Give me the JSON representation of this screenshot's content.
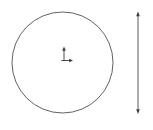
{
  "figure": {
    "title": "",
    "background_color": "#ffffff",
    "line_color": "#4f4f4f",
    "axis_color": "#3a3a3a",
    "dimension_color": "#4a4a4a",
    "width_px": 153,
    "height_px": 130
  },
  "shapes": {
    "circle": {
      "name": "circle-outline",
      "center_x": 62.5,
      "center_y": 62.5,
      "radius": 50.5,
      "stroke_width": 0.9
    },
    "origin_marker": {
      "name": "origin-axes-marker",
      "origin_x": 64,
      "origin_y": 60.5,
      "vertical_axis_length": 14,
      "horizontal_axis_length": 9,
      "vertical_label": "",
      "horizontal_label": ""
    },
    "dimension_line": {
      "name": "vertical-dimension-line",
      "x": 138,
      "y_top": 11.5,
      "y_bottom": 114,
      "length_px": 102.5,
      "arrowheads": "both",
      "value_label": ""
    }
  },
  "labels": {
    "dimension_value": "",
    "figure_caption": ""
  }
}
